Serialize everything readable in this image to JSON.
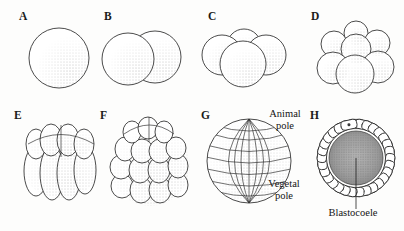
{
  "figure": {
    "background_color": "#fdfdfc",
    "ink_color": "#2b2b2b",
    "panels": [
      {
        "letter": "A",
        "stage": "1-cell zygote",
        "cell_count": 1,
        "view": "whole mount"
      },
      {
        "letter": "B",
        "stage": "2-cell stage",
        "cell_count": 2,
        "view": "whole mount"
      },
      {
        "letter": "C",
        "stage": "4-cell stage",
        "cell_count": 4,
        "view": "whole mount"
      },
      {
        "letter": "D",
        "stage": "8-cell stage",
        "cell_count": 8,
        "view": "whole mount"
      },
      {
        "letter": "E",
        "stage": "16-cell stage",
        "cell_count": 16,
        "view": "whole mount"
      },
      {
        "letter": "F",
        "stage": "32-cell stage",
        "cell_count": 32,
        "view": "whole mount"
      },
      {
        "letter": "G",
        "stage": "blastula",
        "cell_count": 128,
        "view": "surface view"
      },
      {
        "letter": "H",
        "stage": "blastula",
        "cell_count": 128,
        "view": "cross section"
      }
    ],
    "annotations": {
      "animal_pole": "Animal\npole",
      "vegetal_pole": "Vegetal\npole",
      "blastocoele": "Blastocoele"
    }
  }
}
